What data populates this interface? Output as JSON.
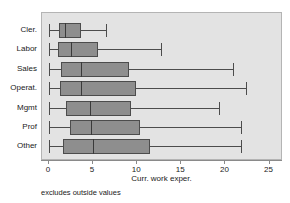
{
  "chart_data": {
    "type": "box",
    "title": "",
    "subtitle": "",
    "xlabel": "Curr. work exper.",
    "ylabel": "",
    "xlim": [
      0,
      25
    ],
    "ylim": null,
    "grid": false,
    "legend": null,
    "orientation": "horizontal",
    "x_ticks": [
      0,
      5,
      10,
      15,
      20,
      25
    ],
    "x_tick_labels": [
      "0",
      "5",
      "10",
      "15",
      "20",
      "25"
    ],
    "categories": [
      "Cler.",
      "Labor",
      "Sales",
      "Operat.",
      "Mgmt",
      "Prof",
      "Other"
    ],
    "annotations": [
      "excludes outside values"
    ],
    "boxes": [
      {
        "category": "Cler.",
        "whisker_low": 0.0,
        "q1": 1.1,
        "median": 1.8,
        "q3": 3.6,
        "whisker_high": 6.5
      },
      {
        "category": "Labor",
        "whisker_low": 0.0,
        "q1": 1.0,
        "median": 2.5,
        "q3": 5.6,
        "whisker_high": 12.7
      },
      {
        "category": "Sales",
        "whisker_low": 0.0,
        "q1": 1.4,
        "median": 3.6,
        "q3": 9.1,
        "whisker_high": 20.9
      },
      {
        "category": "Operat.",
        "whisker_low": 0.0,
        "q1": 1.2,
        "median": 3.6,
        "q3": 9.9,
        "whisker_high": 22.3
      },
      {
        "category": "Mgmt",
        "whisker_low": 0.0,
        "q1": 1.9,
        "median": 4.7,
        "q3": 9.3,
        "whisker_high": 19.3
      },
      {
        "category": "Prof",
        "whisker_low": 0.0,
        "q1": 2.4,
        "median": 4.8,
        "q3": 10.3,
        "whisker_high": 21.8
      },
      {
        "category": "Other",
        "whisker_low": 0.0,
        "q1": 1.6,
        "median": 5.0,
        "q3": 11.4,
        "whisker_high": 21.8
      }
    ],
    "colors": {
      "plot_background": "#e3e3e3",
      "page_background": "#ffffff",
      "box_fill": "#8e8e8e",
      "box_stroke": "#4c4c4c",
      "median": "#3a3a3a",
      "axis": "#8a8a8a",
      "text": "#1a1a1a"
    }
  }
}
